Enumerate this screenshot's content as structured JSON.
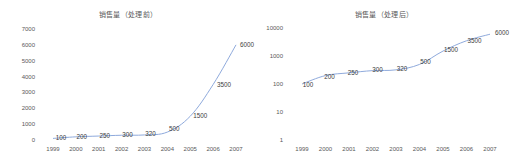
{
  "chart_data": [
    {
      "type": "line",
      "title": "销售量（处理前）",
      "xlabel": "",
      "ylabel": "",
      "y_scale": "linear",
      "ylim": [
        0,
        7000
      ],
      "yticks": [
        0,
        1000,
        2000,
        3000,
        4000,
        5000,
        6000,
        7000
      ],
      "categories": [
        "1999",
        "2000",
        "2001",
        "2002",
        "2003",
        "2004",
        "2005",
        "2006",
        "2007"
      ],
      "series": [
        {
          "name": "销售量",
          "values": [
            100,
            200,
            250,
            300,
            320,
            500,
            1500,
            3500,
            6000
          ]
        }
      ],
      "data_labels": [
        "100",
        "200",
        "250",
        "300",
        "320",
        "500",
        "1500",
        "3500",
        "6000"
      ],
      "grid": false,
      "legend": "none",
      "line_color": "#8faadc"
    },
    {
      "type": "line",
      "title": "销售量（处理后）",
      "xlabel": "",
      "ylabel": "",
      "y_scale": "log10",
      "ylim": [
        1,
        10000
      ],
      "yticks": [
        1,
        10,
        100,
        1000,
        10000
      ],
      "categories": [
        "1999",
        "2000",
        "2001",
        "2002",
        "2003",
        "2004",
        "2005",
        "2006",
        "2007"
      ],
      "series": [
        {
          "name": "销售量",
          "values": [
            100,
            200,
            250,
            300,
            320,
            500,
            1500,
            3500,
            6000
          ]
        }
      ],
      "data_labels": [
        "100",
        "200",
        "250",
        "300",
        "320",
        "500",
        "1500",
        "3500",
        "6000"
      ],
      "grid": false,
      "legend": "none",
      "line_color": "#8faadc"
    }
  ]
}
